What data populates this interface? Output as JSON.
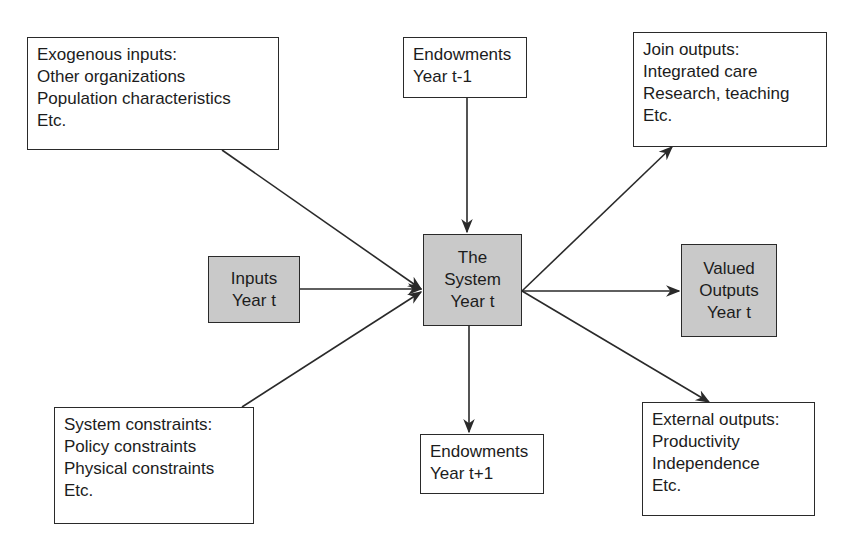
{
  "diagram": {
    "nodes": {
      "exogenous": {
        "title": "Exogenous inputs:",
        "lines": [
          "Other organizations",
          "Population characteristics",
          "Etc."
        ]
      },
      "endowments_prev": {
        "lines": [
          "Endowments",
          "Year t-1"
        ]
      },
      "join_outputs": {
        "title": "Join outputs:",
        "lines": [
          "Integrated care",
          "Research, teaching",
          "Etc."
        ]
      },
      "inputs": {
        "lines": [
          "Inputs",
          "Year t"
        ]
      },
      "system": {
        "lines": [
          "The",
          "System",
          "Year t"
        ]
      },
      "valued_outputs": {
        "lines": [
          "Valued",
          "Outputs",
          "Year t"
        ]
      },
      "system_constraints": {
        "title": "System constraints:",
        "lines": [
          "Policy constraints",
          "Physical constraints",
          "Etc."
        ]
      },
      "endowments_next": {
        "lines": [
          "Endowments",
          "Year t+1"
        ]
      },
      "external_outputs": {
        "title": "External outputs:",
        "lines": [
          "Productivity",
          "Independence",
          "Etc."
        ]
      }
    },
    "edges": [
      {
        "from": "exogenous",
        "to": "system"
      },
      {
        "from": "endowments_prev",
        "to": "system"
      },
      {
        "from": "inputs",
        "to": "system"
      },
      {
        "from": "system_constraints",
        "to": "system"
      },
      {
        "from": "system",
        "to": "join_outputs"
      },
      {
        "from": "system",
        "to": "valued_outputs"
      },
      {
        "from": "system",
        "to": "external_outputs"
      },
      {
        "from": "system",
        "to": "endowments_next"
      }
    ],
    "colors": {
      "shaded_fill": "#c9c9c9",
      "border": "#2a2a2a",
      "background": "#ffffff"
    }
  }
}
